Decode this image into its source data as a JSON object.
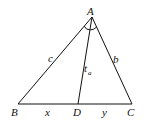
{
  "diagram": {
    "type": "triangle-with-angle-bisector",
    "vertices": {
      "A": {
        "label": "A",
        "x": 92,
        "y": 17
      },
      "B": {
        "label": "B",
        "x": 18,
        "y": 104
      },
      "C": {
        "label": "C",
        "x": 132,
        "y": 104
      },
      "D": {
        "label": "D",
        "x": 78,
        "y": 104
      }
    },
    "sides": {
      "c": {
        "label": "c",
        "from": "A",
        "to": "B"
      },
      "b": {
        "label": "b",
        "from": "A",
        "to": "C"
      },
      "bisector": {
        "label": "t",
        "subscript": "a",
        "from": "A",
        "to": "D"
      }
    },
    "segments": {
      "x": {
        "label": "x",
        "from": "B",
        "to": "D"
      },
      "y": {
        "label": "y",
        "from": "D",
        "to": "C"
      }
    },
    "stroke_color": "#111111"
  }
}
